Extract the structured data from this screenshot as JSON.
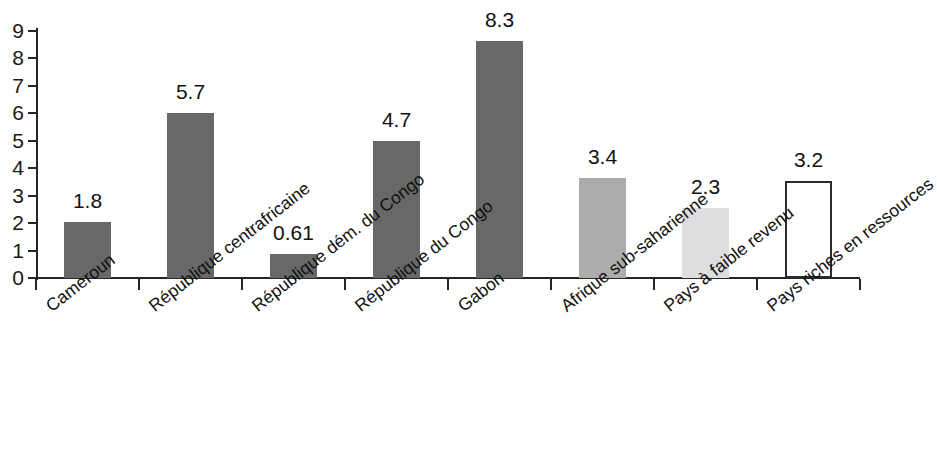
{
  "chart_data": {
    "type": "bar",
    "title": "",
    "subtitle": "",
    "xlabel": "",
    "ylabel": "",
    "ylim": [
      0,
      9
    ],
    "y_ticks": [
      0,
      1,
      2,
      3,
      4,
      5,
      6,
      7,
      8,
      9
    ],
    "grid": false,
    "legend": null,
    "categories": [
      "Cameroun",
      "République centrafricaine",
      "République dém. du Congo",
      "République du Congo",
      "Gabon",
      "Afrique sub-saharienne",
      "Pays à faible revenu",
      "Pays riches en ressources"
    ],
    "values": [
      1.8,
      5.7,
      0.61,
      4.7,
      8.3,
      3.4,
      2.3,
      3.2
    ],
    "value_labels": [
      "1.8",
      "5.7",
      "0.61",
      "4.7",
      "8.3",
      "3.4",
      "2.3",
      "3.2"
    ],
    "bar_plotted_heights": [
      2.05,
      6.0,
      0.88,
      5.0,
      8.65,
      3.65,
      2.55,
      3.55
    ],
    "bar_styles": [
      "dark",
      "dark",
      "dark",
      "dark",
      "dark",
      "mid",
      "light",
      "outline"
    ],
    "colors": {
      "dark": "#686868",
      "mid": "#acacac",
      "light": "#dedede",
      "outline_fill": "#ffffff",
      "outline_stroke": "#2b2b2b",
      "axis": "#262626",
      "text": "#111111",
      "background": "#ffffff"
    }
  }
}
